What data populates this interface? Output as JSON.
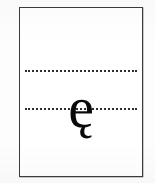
{
  "page": {
    "name": "letter-specimen-sheet",
    "background_color": "#fdfdfd",
    "paper_color": "#ffffff",
    "frame_color": "#3b3b3b"
  },
  "guides": {
    "ink_color": "#2e2e2e",
    "style": "dotted",
    "lines": [
      {
        "id": "x-height",
        "label": "x-height guide line"
      },
      {
        "id": "baseline",
        "label": "baseline guide line"
      }
    ]
  },
  "specimen": {
    "glyph": "ę",
    "character_name": "latin small letter e with ogonek",
    "ink_color": "#0a0a0a"
  }
}
